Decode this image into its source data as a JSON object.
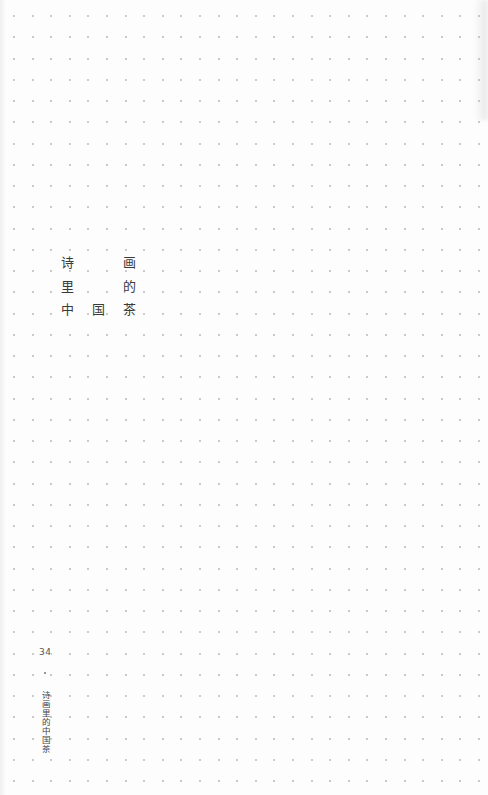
{
  "page": {
    "background": "#fdfdfd",
    "dot_color": "#b8b8b8",
    "grid": {
      "cols": 26,
      "rows": 37,
      "x0": 13,
      "y0": 15,
      "dx": 18.6,
      "dy": 21.25
    }
  },
  "title": {
    "chars": [
      {
        "text": "诗",
        "x": 60,
        "y": 255
      },
      {
        "text": "画",
        "x": 122,
        "y": 255
      },
      {
        "text": "里",
        "x": 60,
        "y": 279
      },
      {
        "text": "的",
        "x": 122,
        "y": 279
      },
      {
        "text": "中",
        "x": 60,
        "y": 302
      },
      {
        "text": "国",
        "x": 91,
        "y": 302
      },
      {
        "text": "茶",
        "x": 122,
        "y": 302
      }
    ]
  },
  "footer": {
    "page_number": "34",
    "running_title": "诗画里的中国茶"
  }
}
